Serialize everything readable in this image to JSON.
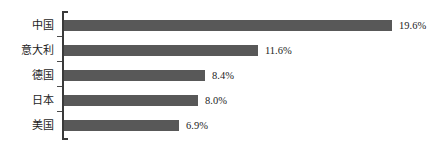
{
  "chart_data": {
    "type": "bar",
    "orientation": "horizontal",
    "title": "",
    "subtitle": "",
    "xlabel": "",
    "ylabel": "",
    "categories": [
      "中国",
      "意大利",
      "德国",
      "日本",
      "美国"
    ],
    "values": [
      19.6,
      11.6,
      8.4,
      8.0,
      6.9
    ],
    "value_labels": [
      "19.6%",
      "11.6%",
      "8.4%",
      "8.0%",
      "6.9%"
    ],
    "unit": "%",
    "xlim": [
      0,
      19.6
    ],
    "grid": false,
    "legend": false,
    "x_axis_visible": false,
    "y_axis_visible": true,
    "bar_color": "#585858",
    "axis_color": "#3a3a3a",
    "text_color": "#1d1d1d",
    "background_color": "#ffffff",
    "series": [
      {
        "name": "",
        "points": [
          {
            "category": "中国",
            "value": 19.6,
            "label": "19.6%"
          },
          {
            "category": "意大利",
            "value": 11.6,
            "label": "11.6%"
          },
          {
            "category": "德国",
            "value": 8.4,
            "label": "8.4%"
          },
          {
            "category": "日本",
            "value": 8.0,
            "label": "8.0%"
          },
          {
            "category": "美国",
            "value": 6.9,
            "label": "6.9%"
          }
        ]
      }
    ]
  },
  "layout": {
    "axis_x": 62,
    "bar_origin_x": 64,
    "plot_right": 437,
    "row_tops": [
      13,
      38,
      63,
      88,
      113
    ],
    "row_height": 25,
    "bar_height": 11,
    "max_bar_width": 328,
    "tick_tops": [
      36,
      61,
      86,
      111
    ]
  }
}
